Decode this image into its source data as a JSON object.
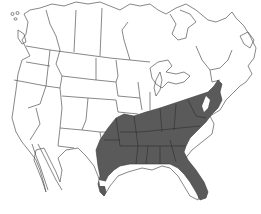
{
  "map": {
    "type": "species-range-map",
    "region": "North America (Canada, United States, northern Mexico)",
    "projection_hint": "conic outline",
    "background_color": "#ffffff",
    "outline_color": "#555555",
    "range_fill_color": "#5a5a5a",
    "range_border_color": "#3a3a3a",
    "range": {
      "label": "distribution range",
      "description": "Southeastern United States",
      "states_shaded": [
        "Texas (eastern)",
        "Oklahoma (eastern)",
        "Arkansas",
        "Louisiana",
        "Missouri (southern)",
        "Illinois (southern)",
        "Indiana (southern)",
        "Ohio (southern)",
        "Kentucky",
        "Tennessee",
        "Mississippi",
        "Alabama",
        "Georgia",
        "Florida",
        "South Carolina",
        "North Carolina",
        "Virginia",
        "West Virginia",
        "Maryland",
        "Delaware",
        "New Jersey (southern)",
        "Pennsylvania (southeastern)"
      ]
    },
    "text_labels": []
  }
}
